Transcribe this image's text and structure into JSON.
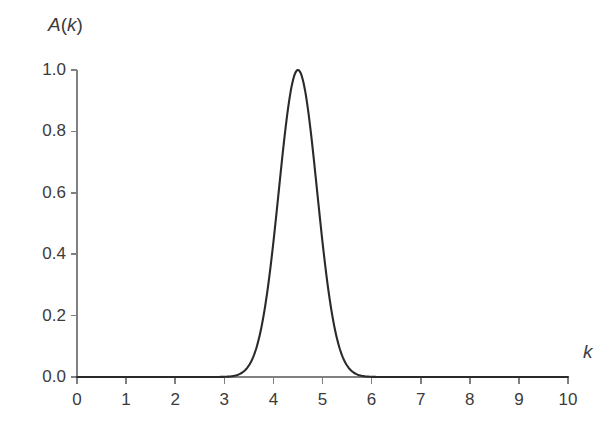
{
  "chart_data": {
    "type": "line",
    "title": "",
    "subtitle": "",
    "xlabel": "k",
    "ylabel": "A(k)",
    "xlim": [
      0,
      10
    ],
    "ylim": [
      0.0,
      1.0
    ],
    "grid": false,
    "legend": null,
    "legend_position": "none",
    "annotations": [],
    "x_ticks": [
      "0",
      "1",
      "2",
      "3",
      "4",
      "5",
      "6",
      "7",
      "8",
      "9",
      "10"
    ],
    "x_tick_values": [
      0,
      1,
      2,
      3,
      4,
      5,
      6,
      7,
      8,
      9,
      10
    ],
    "y_ticks": [
      "0.0",
      "0.2",
      "0.4",
      "0.6",
      "0.8",
      "1.0"
    ],
    "y_tick_values": [
      0.0,
      0.2,
      0.4,
      0.6,
      0.8,
      1.0
    ],
    "series": [
      {
        "name": "A(k)",
        "shape": "gaussian",
        "center": 4.5,
        "peak": 1.0,
        "sigma": 0.39,
        "fwhm": 0.92,
        "color": "#2a2a2a",
        "x": [
          0.0,
          0.5,
          1.0,
          1.5,
          2.0,
          2.5,
          2.8,
          3.0,
          3.2,
          3.4,
          3.6,
          3.8,
          4.0,
          4.1,
          4.2,
          4.3,
          4.4,
          4.5,
          4.6,
          4.7,
          4.8,
          4.9,
          5.0,
          5.2,
          5.4,
          5.6,
          5.8,
          6.0,
          6.5,
          7.0,
          7.5,
          8.0,
          8.5,
          9.0,
          9.5,
          10.0
        ],
        "values": [
          0.0,
          0.0,
          0.0,
          0.0,
          0.0,
          0.0,
          0.002,
          0.008,
          0.025,
          0.066,
          0.148,
          0.285,
          0.474,
          0.578,
          0.678,
          0.799,
          0.92,
          1.0,
          0.92,
          0.799,
          0.678,
          0.578,
          0.474,
          0.285,
          0.148,
          0.066,
          0.025,
          0.008,
          0.0,
          0.0,
          0.0,
          0.0,
          0.0,
          0.0,
          0.0,
          0.0
        ]
      }
    ],
    "axis_color": "#808080",
    "curve_color": "#2a2a2a",
    "background_color": "#ffffff",
    "text_color": "#3b3b3b"
  },
  "labels": {
    "y_axis_title_main": "A",
    "y_axis_title_open": "(",
    "y_axis_title_var": "k",
    "y_axis_title_close": ")",
    "x_axis_title": "k"
  }
}
